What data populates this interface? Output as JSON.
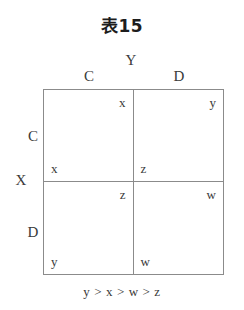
{
  "title": "表15",
  "matrix": {
    "column_axis_label": "Y",
    "row_axis_label": "X",
    "column_headers": [
      "C",
      "D"
    ],
    "row_headers": [
      "C",
      "D"
    ],
    "cells": [
      {
        "row": "C",
        "column": "C",
        "row_player_payoff": "x",
        "column_player_payoff": "x"
      },
      {
        "row": "C",
        "column": "D",
        "row_player_payoff": "z",
        "column_player_payoff": "y"
      },
      {
        "row": "D",
        "column": "C",
        "row_player_payoff": "y",
        "column_player_payoff": "z"
      },
      {
        "row": "D",
        "column": "D",
        "row_player_payoff": "w",
        "column_player_payoff": "w"
      }
    ]
  },
  "caption": "y > x > w > z",
  "colors": {
    "background": "#ffffff",
    "line": "#8b8b8b",
    "text": "#3a3a3a",
    "title_text": "#1d1d1d"
  }
}
